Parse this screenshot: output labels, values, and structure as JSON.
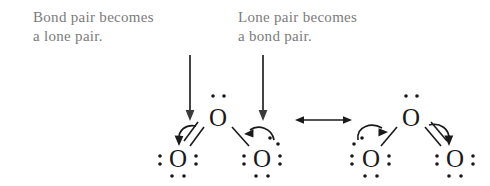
{
  "figure": {
    "text_color": "#7b7b7b",
    "structure_color": "#1a1a1a",
    "background": "#ffffff"
  },
  "captions": [
    {
      "id": "bond-to-lone",
      "text": "Bond pair becomes\na lone pair.",
      "x": 33,
      "y": 8
    },
    {
      "id": "lone-to-bond",
      "text": "Lone pair becomes\na bond pair.",
      "x": 238,
      "y": 8
    }
  ],
  "pointer_arrows": [
    {
      "id": "pointer-left",
      "x": 190,
      "y_start": 55,
      "y_end": 120
    },
    {
      "id": "pointer-right",
      "x": 263,
      "y_start": 55,
      "y_end": 120
    }
  ],
  "resonance_arrow": {
    "label": "double-headed-resonance-arrow",
    "glyph": "⟷",
    "x_start": 296,
    "x_end": 351,
    "y": 120
  },
  "structures": [
    {
      "id": "left-structure",
      "name": "ozone-resonance-left",
      "atoms": [
        {
          "id": "o-center-left",
          "label": "O",
          "x": 218,
          "y": 117
        },
        {
          "id": "o-terminal-left-left",
          "label": "O",
          "x": 178,
          "y": 158
        },
        {
          "id": "o-terminal-right-left",
          "label": "O",
          "x": 262,
          "y": 158
        }
      ],
      "bonds": [
        {
          "from": "o-center-left",
          "to": "o-terminal-left-left",
          "order": 2
        },
        {
          "from": "o-center-left",
          "to": "o-terminal-right-left",
          "order": 1
        }
      ],
      "curved_arrows": [
        {
          "id": "arrow-double-bond-to-left-o",
          "meaning": "bond pair becomes a lone pair"
        },
        {
          "id": "arrow-right-o-lone-to-bond",
          "meaning": "lone pair becomes a bond pair"
        }
      ]
    },
    {
      "id": "right-structure",
      "name": "ozone-resonance-right",
      "atoms": [
        {
          "id": "o-center-right",
          "label": "O",
          "x": 411,
          "y": 117
        },
        {
          "id": "o-terminal-left-right",
          "label": "O",
          "x": 371,
          "y": 158
        },
        {
          "id": "o-terminal-right-right",
          "label": "O",
          "x": 455,
          "y": 158
        }
      ],
      "bonds": [
        {
          "from": "o-center-right",
          "to": "o-terminal-left-right",
          "order": 1
        },
        {
          "from": "o-center-right",
          "to": "o-terminal-right-right",
          "order": 2
        }
      ],
      "curved_arrows": [
        {
          "id": "arrow-left-o-lone-to-bond",
          "meaning": "lone pair becomes a bond pair"
        },
        {
          "id": "arrow-double-bond-to-right-o",
          "meaning": "bond pair becomes a lone pair"
        }
      ]
    }
  ]
}
